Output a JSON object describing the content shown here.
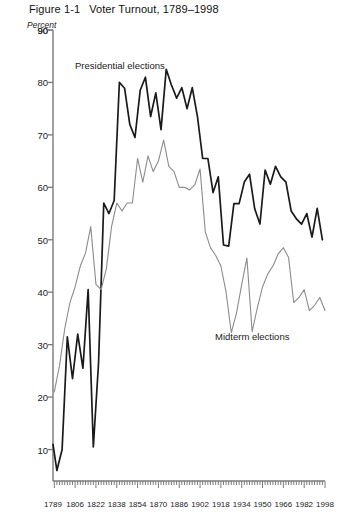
{
  "figure": {
    "number": "Figure 1-1",
    "title": "Voter Turnout, 1789–1998",
    "unit_label": "Percent"
  },
  "labels": {
    "presidential": "Presidential elections",
    "midterm": "Midterm elections"
  },
  "colors": {
    "presidential_line": "#1a1a1a",
    "midterm_line": "#8c8c8c",
    "axis": "#7a7a7a",
    "text": "#1a1a1a",
    "background": "#ffffff"
  },
  "chart_data": {
    "type": "line",
    "title": "Voter Turnout, 1789–1998",
    "xlabel": "",
    "ylabel": "Percent",
    "xlim": [
      1789,
      1998
    ],
    "ylim": [
      4,
      90
    ],
    "grid": false,
    "legend": "inline-annotations",
    "yticks": [
      10,
      20,
      30,
      40,
      50,
      60,
      70,
      80,
      90
    ],
    "xticks": [
      1789,
      1806,
      1822,
      1838,
      1854,
      1870,
      1886,
      1902,
      1918,
      1934,
      1950,
      1966,
      1982,
      1998
    ],
    "xtick_labels": [
      "1789",
      "1806",
      "1822",
      "1838",
      "1854",
      "1870",
      "1886",
      "1902",
      "1918",
      "1934",
      "1950",
      "1966",
      "1982",
      "1998"
    ],
    "minor_tick_interval": 2,
    "series": [
      {
        "name": "Presidential elections",
        "color": "#1a1a1a",
        "x": [
          1789,
          1792,
          1796,
          1800,
          1804,
          1808,
          1812,
          1816,
          1820,
          1824,
          1828,
          1832,
          1836,
          1840,
          1844,
          1848,
          1852,
          1856,
          1860,
          1864,
          1868,
          1872,
          1876,
          1880,
          1884,
          1888,
          1892,
          1896,
          1900,
          1904,
          1908,
          1912,
          1916,
          1920,
          1924,
          1928,
          1932,
          1936,
          1940,
          1944,
          1948,
          1952,
          1956,
          1960,
          1964,
          1968,
          1972,
          1976,
          1980,
          1984,
          1988,
          1992,
          1996
        ],
        "values": [
          11.0,
          6.0,
          10.0,
          31.5,
          23.5,
          32.0,
          25.5,
          40.5,
          10.5,
          26.5,
          57.0,
          55.0,
          57.5,
          80.0,
          78.9,
          72.0,
          69.5,
          78.5,
          81.0,
          73.5,
          78.0,
          71.0,
          82.5,
          79.5,
          77.0,
          79.0,
          75.0,
          79.0,
          73.5,
          65.5,
          65.5,
          59.0,
          62.0,
          49.0,
          48.8,
          56.9,
          56.9,
          61.0,
          62.5,
          55.9,
          53.0,
          63.3,
          60.6,
          64.0,
          62.0,
          61.0,
          55.5,
          54.0,
          53.0,
          55.0,
          50.5,
          56.0,
          50.0
        ],
        "units": "percent"
      },
      {
        "name": "Midterm elections",
        "color": "#8c8c8c",
        "x": [
          1790,
          1794,
          1798,
          1802,
          1806,
          1810,
          1814,
          1818,
          1822,
          1826,
          1830,
          1834,
          1838,
          1842,
          1846,
          1850,
          1854,
          1858,
          1862,
          1866,
          1870,
          1874,
          1878,
          1882,
          1886,
          1890,
          1894,
          1898,
          1902,
          1906,
          1910,
          1914,
          1918,
          1922,
          1926,
          1930,
          1934,
          1938,
          1942,
          1946,
          1950,
          1954,
          1958,
          1962,
          1966,
          1970,
          1974,
          1978,
          1982,
          1986,
          1990,
          1994,
          1998
        ],
        "values": [
          21.0,
          26.0,
          33.0,
          38.0,
          41.0,
          45.0,
          47.5,
          52.5,
          41.5,
          40.5,
          44.5,
          52.5,
          57.0,
          55.5,
          57.0,
          57.0,
          65.5,
          61.0,
          66.0,
          63.0,
          65.0,
          69.0,
          64.0,
          63.0,
          60.0,
          60.0,
          59.5,
          60.5,
          63.5,
          51.5,
          48.5,
          47.0,
          45.0,
          40.0,
          32.3,
          36.0,
          41.5,
          46.5,
          32.5,
          37.0,
          41.0,
          43.5,
          45.0,
          47.3,
          48.5,
          46.6,
          38.0,
          39.0,
          40.5,
          36.5,
          37.5,
          39.0,
          36.5
        ],
        "units": "percent"
      }
    ]
  }
}
